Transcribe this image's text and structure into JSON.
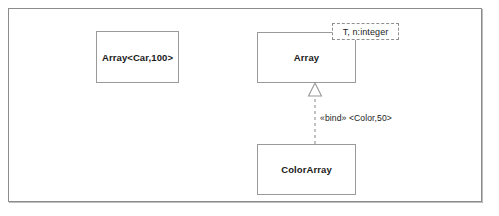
{
  "diagram": {
    "type": "uml-class-diagram",
    "frame": {
      "border_color": "#8c8c8c",
      "background": "#ffffff"
    },
    "bound_class": {
      "name": "Array<Car,100>"
    },
    "template_class": {
      "name": "Array",
      "template_parameters": "T, n:integer"
    },
    "derived_class": {
      "name": "ColorArray"
    },
    "binding_relation": {
      "stereotype": "«bind»",
      "arguments": "<Color,50>",
      "label": "«bind» <Color,50>",
      "line_style": "dashed",
      "arrowhead": "hollow-triangle",
      "from": "ColorArray",
      "to": "Array"
    },
    "colors": {
      "box_border": "#9a9a9a",
      "dashed_border": "#8f8f8f",
      "text": "#1a1a1a",
      "connector": "#9a9a9a"
    }
  }
}
